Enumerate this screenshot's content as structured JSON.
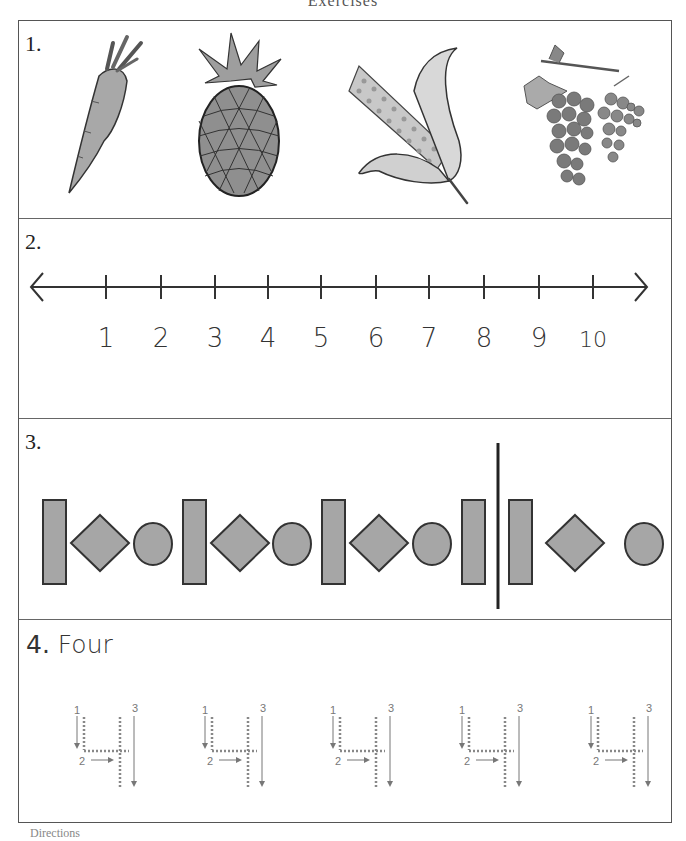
{
  "page": {
    "header_title": "Exercises",
    "footer_text": "Directions"
  },
  "questions": [
    {
      "number": "1.",
      "type": "picture-row",
      "items": [
        {
          "name": "carrot",
          "icon": "carrot-icon"
        },
        {
          "name": "pineapple",
          "icon": "pineapple-icon"
        },
        {
          "name": "corn",
          "icon": "corn-icon"
        },
        {
          "name": "grapes",
          "icon": "grapes-icon"
        }
      ]
    },
    {
      "number": "2.",
      "type": "number-line",
      "labels": [
        "1",
        "2",
        "3",
        "4",
        "5",
        "6",
        "7",
        "8",
        "9",
        "10"
      ]
    },
    {
      "number": "3.",
      "type": "shape-pattern",
      "pattern": [
        "rectangle",
        "diamond",
        "circle",
        "rectangle",
        "diamond",
        "circle",
        "rectangle",
        "diamond",
        "circle",
        "rectangle",
        "divider",
        "rectangle",
        "diamond",
        "circle"
      ],
      "fill_color": "#a6a6a6",
      "stroke_color": "#333333"
    },
    {
      "number": "4.",
      "word": "Four",
      "type": "tracing",
      "tracing_items": [
        {
          "stroke_labels": [
            "1",
            "2",
            "3"
          ]
        },
        {
          "stroke_labels": [
            "1",
            "2",
            "3"
          ]
        },
        {
          "stroke_labels": [
            "1",
            "2",
            "3"
          ]
        },
        {
          "stroke_labels": [
            "1",
            "2",
            "3"
          ]
        },
        {
          "stroke_labels": [
            "1",
            "2",
            "3"
          ]
        }
      ]
    }
  ]
}
